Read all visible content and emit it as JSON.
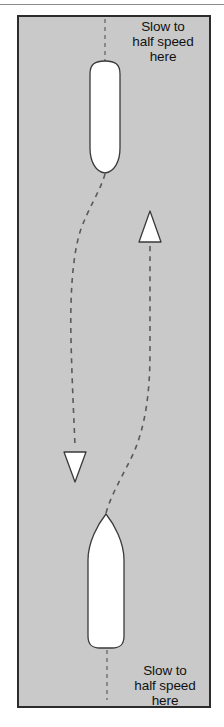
{
  "figure": {
    "name": "boat-passing-maneuver-diagram",
    "panel": {
      "background_color": "#c9c9c9",
      "border_color": "#2c2c2c"
    },
    "annotations": [
      {
        "id": "top-slow-label",
        "text": "Slow to\nhalf speed\nhere",
        "position": "top-right"
      },
      {
        "id": "bottom-slow-label",
        "text": "Slow to\nhalf speed\nhere",
        "position": "bottom-right"
      }
    ],
    "vessels": [
      {
        "id": "upper-vessel",
        "heading": "down",
        "fill_color": "#ffffff",
        "outline_color": "#3a3a3a"
      },
      {
        "id": "lower-vessel",
        "heading": "up",
        "fill_color": "#ffffff",
        "outline_color": "#3a3a3a"
      }
    ],
    "arrows": [
      {
        "id": "up-arrow",
        "direction": "up",
        "fill_color": "#ffffff",
        "outline_color": "#3a3a3a"
      },
      {
        "id": "down-arrow",
        "direction": "down",
        "fill_color": "#ffffff",
        "outline_color": "#3a3a3a"
      }
    ],
    "paths": [
      {
        "id": "left-track",
        "style": "dashed",
        "color": "#5a5a5a",
        "description": "curved track descending to down arrow"
      },
      {
        "id": "right-track",
        "style": "dashed",
        "color": "#5a5a5a",
        "description": "curved track ascending to up arrow"
      },
      {
        "id": "top-centerline",
        "style": "dashed",
        "color": "#6e6e6e"
      },
      {
        "id": "bottom-centerline",
        "style": "dashed",
        "color": "#6e6e6e"
      }
    ]
  }
}
